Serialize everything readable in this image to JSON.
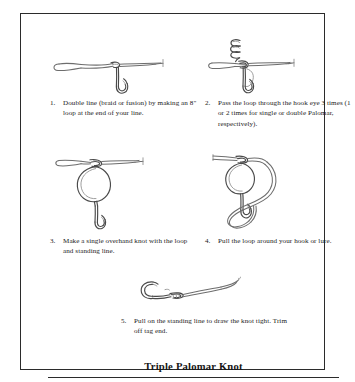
{
  "document": {
    "title": "Triple Palomar Knot",
    "type": "fishing-knot-instruction-diagram"
  },
  "steps": [
    {
      "number": "1.",
      "text": "Double line (braid or fusion) by making an 8\" loop at the end of your line.",
      "illustration": "doubled-line-through-hook-eye"
    },
    {
      "number": "2.",
      "text": "Pass the loop through the hook eye 3 times (1 or 2 times for single or double Palomar, respectively).",
      "illustration": "loop-coiled-three-times-through-hook-eye"
    },
    {
      "number": "3.",
      "text": "Make a single overhand knot with the loop and standing line.",
      "illustration": "overhand-knot-loop-around-hook"
    },
    {
      "number": "4.",
      "text": "Pull the loop around your hook or lure.",
      "illustration": "loop-passed-around-hook"
    },
    {
      "number": "5.",
      "text": "Pull on the standing line to draw the knot tight. Trim off tag end.",
      "illustration": "finished-tightened-knot-on-hook"
    }
  ],
  "colors": {
    "frame": "#2b2b2b",
    "sketch_stroke": "#6d6d6d",
    "sketch_stroke_dark": "#4a4a4a",
    "text": "#1b1b1b",
    "background": "#ffffff"
  }
}
